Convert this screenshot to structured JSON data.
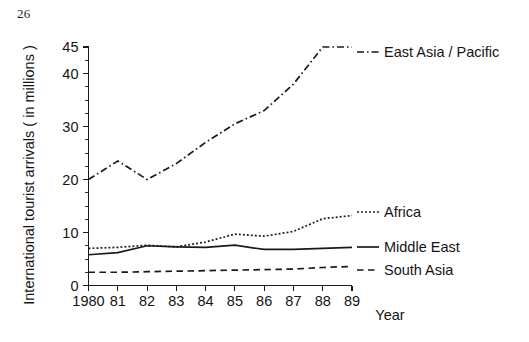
{
  "page": {
    "number": "26"
  },
  "chart_data": {
    "type": "line",
    "title": "",
    "xlabel": "Year",
    "ylabel": "International tourist arrivals ( in millions )",
    "x": [
      1980,
      1981,
      1982,
      1983,
      1984,
      1985,
      1986,
      1987,
      1988,
      1989
    ],
    "categories": [
      "1980",
      "81",
      "82",
      "83",
      "84",
      "85",
      "86",
      "87",
      "88",
      "89"
    ],
    "xlim": [
      1980,
      1989
    ],
    "ylim": [
      0,
      45
    ],
    "yticks": [
      0,
      10,
      20,
      30,
      40,
      45
    ],
    "ytick_labels": [
      "0",
      "10",
      "20",
      "30",
      "40",
      "45"
    ],
    "yminor_step": 2.5,
    "grid": false,
    "legend_position": "right-inline",
    "series": [
      {
        "name": "East Asia / Pacific",
        "style": "dash-dot",
        "color": "#1a1a1a",
        "values": [
          20,
          23.5,
          20,
          23,
          27,
          30.5,
          33,
          38,
          45,
          45
        ]
      },
      {
        "name": "Africa",
        "style": "dotted",
        "color": "#1a1a1a",
        "values": [
          7,
          7.2,
          7.6,
          7.3,
          8.2,
          9.7,
          9.3,
          10.2,
          12.6,
          13.2
        ]
      },
      {
        "name": "Middle East",
        "style": "solid",
        "color": "#1a1a1a",
        "values": [
          5.8,
          6.2,
          7.5,
          7.3,
          7.2,
          7.6,
          6.8,
          6.8,
          7.0,
          7.2
        ]
      },
      {
        "name": "South Asia",
        "style": "dashed",
        "color": "#1a1a1a",
        "values": [
          2.5,
          2.5,
          2.6,
          2.7,
          2.8,
          2.9,
          3.0,
          3.1,
          3.4,
          3.6
        ]
      }
    ]
  }
}
